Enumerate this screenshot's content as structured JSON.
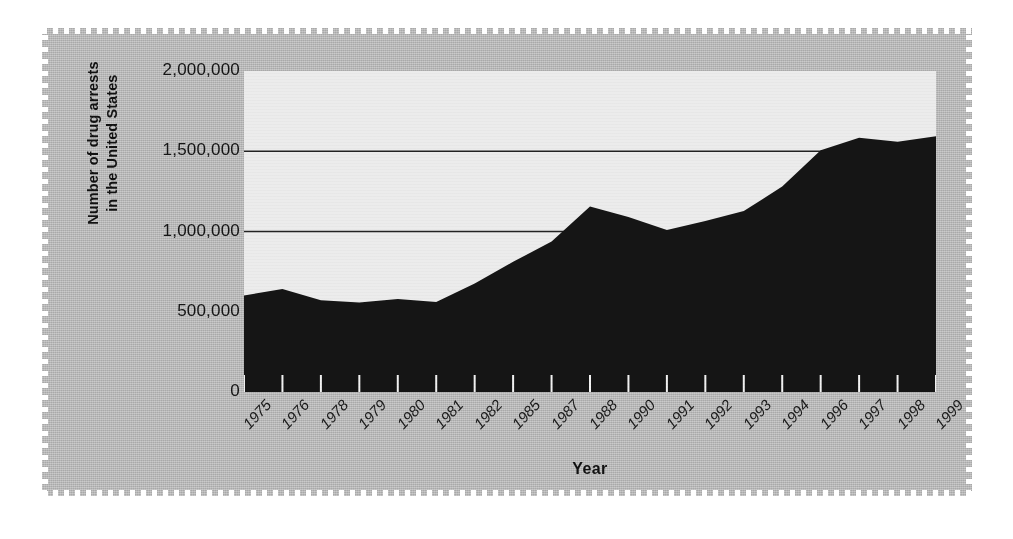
{
  "chart_data": {
    "type": "area",
    "title": "",
    "xlabel": "Year",
    "ylabel": "Number of drug arrests in the United States",
    "ylabel_line1": "Number of drug arrests",
    "ylabel_line2": "in the United States",
    "categories": [
      "1975",
      "1976",
      "1978",
      "1979",
      "1980",
      "1981",
      "1982",
      "1985",
      "1987",
      "1988",
      "1990",
      "1991",
      "1992",
      "1993",
      "1994",
      "1996",
      "1997",
      "1998",
      "1999"
    ],
    "values": [
      601400,
      642000,
      572000,
      558000,
      580000,
      560000,
      676000,
      811000,
      937000,
      1155000,
      1090000,
      1010000,
      1066000,
      1127000,
      1280000,
      1506000,
      1584000,
      1559000,
      1593000
    ],
    "ylim": [
      0,
      2000000
    ],
    "ytick_labels": [
      "2,000,000",
      "1,500,000",
      "1,000,000",
      "500,000",
      "0"
    ],
    "ytick_values": [
      2000000,
      1500000,
      1000000,
      500000,
      0
    ],
    "gridlines_at": [
      1500000,
      1000000
    ],
    "grid": true,
    "legend": "none",
    "series_color": "#151515",
    "plot_background": "#ececec",
    "page_background": "#b9b9b9"
  },
  "figure": {
    "y_axis_title_name": "Number of drug arrests in the United States",
    "x_axis_title_name": "Year"
  }
}
